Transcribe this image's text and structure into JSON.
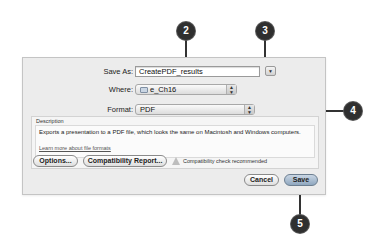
{
  "dialog": {
    "save_as_label": "Save As:",
    "save_as_value": "CreatePDF_results",
    "where_label": "Where:",
    "where_value": "e_Ch16",
    "where_icon": "folder-icon",
    "format_label": "Format:",
    "format_value": "PDF",
    "description_label": "Description",
    "description_text": "Exports a presentation to a PDF file, which looks the same on Macintosh and Windows computers.",
    "learn_more_link": "Learn more about file formats",
    "options_button": "Options...",
    "compat_report_button": "Compatibility Report...",
    "compat_warning": "Compatibility check recommended",
    "cancel_button": "Cancel",
    "save_button": "Save",
    "expand_glyph": "▼",
    "popup_glyph_up": "▲",
    "popup_glyph_down": "▼"
  },
  "callouts": [
    {
      "number": "2"
    },
    {
      "number": "3"
    },
    {
      "number": "4"
    },
    {
      "number": "5"
    }
  ]
}
